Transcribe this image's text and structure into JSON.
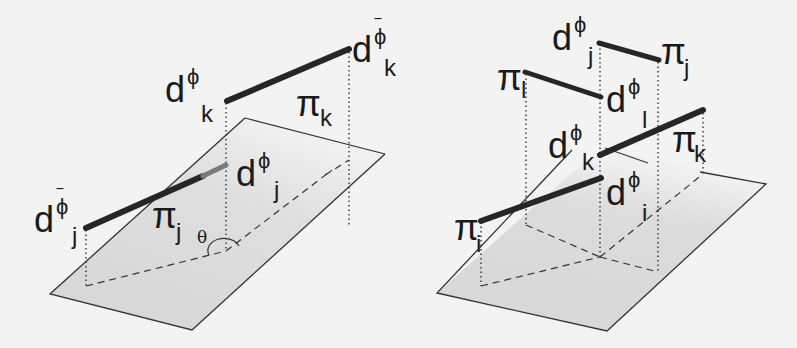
{
  "left_diagram": {
    "labels": {
      "dk_bar": {
        "base": "d",
        "sup": "ϕ",
        "bar": "‾",
        "sub": "k"
      },
      "dk": {
        "base": "d",
        "sup": "ϕ",
        "sub": "k"
      },
      "pik": {
        "base": "π",
        "sub": "k"
      },
      "dj": {
        "base": "d",
        "sup": "ϕ",
        "sub": "j"
      },
      "dj_bar": {
        "base": "d",
        "sup": "ϕ",
        "bar": "‾",
        "sub": "j"
      },
      "pij": {
        "base": "π",
        "sub": "j"
      },
      "theta": "θ"
    }
  },
  "right_diagram": {
    "labels": {
      "dj": {
        "base": "d",
        "sup": "ϕ",
        "sub": "j"
      },
      "pij": {
        "base": "π",
        "sub": "j"
      },
      "pil": {
        "base": "π",
        "sub": "l"
      },
      "dl": {
        "base": "d",
        "sup": "ϕ",
        "sub": "l"
      },
      "dk": {
        "base": "d",
        "sup": "ϕ",
        "sub": "k"
      },
      "pik": {
        "base": "π",
        "sub": "k"
      },
      "pii": {
        "base": "π",
        "sub": "i"
      },
      "di": {
        "base": "d",
        "sup": "ϕ",
        "sub": "i"
      }
    }
  },
  "colors": {
    "background": "#f3f3f3",
    "plane_fill": "#d9d9d9",
    "line": "#2a2a2a",
    "bar_line": "#262626"
  }
}
